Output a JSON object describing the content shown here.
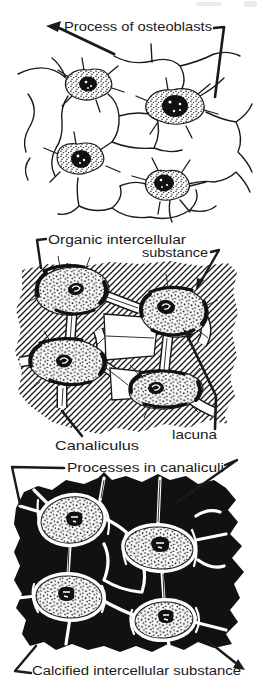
{
  "figure": {
    "ink_color": "#1a1a1a",
    "paper_color": "#ffffff",
    "panel1": {
      "label_process": "Process of osteoblasts"
    },
    "panel2": {
      "label_organic_line1": "Organic intercellular",
      "label_organic_line2": "substance",
      "label_canaliculus": "Canaliculus",
      "label_lacuna": "lacuna"
    },
    "panel3": {
      "label_processes": "Processes in canaliculi",
      "label_calcified": "Calcified intercellular substance"
    }
  }
}
